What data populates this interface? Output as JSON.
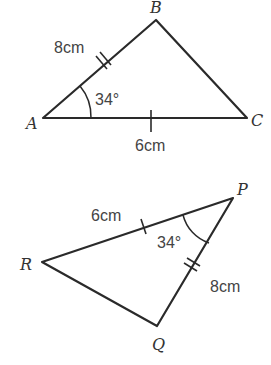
{
  "triangle_abc": {
    "vertices": {
      "A": "A",
      "B": "B",
      "C": "C"
    },
    "side_ab": "8cm",
    "side_ac": "6cm",
    "angle_a": "34°"
  },
  "triangle_pqr": {
    "vertices": {
      "P": "P",
      "Q": "Q",
      "R": "R"
    },
    "side_pr": "6cm",
    "side_pq": "8cm",
    "angle_p": "34°"
  }
}
